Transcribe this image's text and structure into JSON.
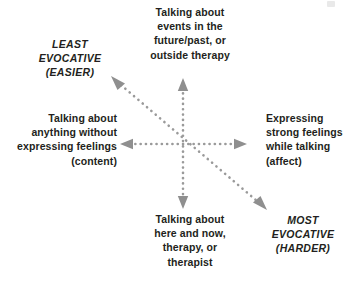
{
  "diagram": {
    "axes": {
      "vertical": {
        "top_label": "Talking about events in the future/past, or outside therapy",
        "top_lines": [
          "Talking about",
          "events in the",
          "future/past, or",
          "outside therapy"
        ],
        "bottom_label": "Talking about here and now, therapy, or therapist",
        "bottom_lines": [
          "Talking about",
          "here and now,",
          "therapy, or",
          "therapist"
        ]
      },
      "horizontal": {
        "left_label": "Talking about anything without expressing feelings (content)",
        "left_lines": [
          "Talking about",
          "anything without",
          "expressing feelings",
          "(content)"
        ],
        "right_label": "Expressing strong feelings while talking (affect)",
        "right_lines": [
          "Expressing",
          "strong feelings",
          "while talking",
          "(affect)"
        ]
      },
      "diagonal": {
        "upper_left_label": "LEAST EVOCATIVE (EASIER)",
        "upper_left_lines": [
          "LEAST",
          "EVOCATIVE",
          "(EASIER)"
        ],
        "lower_right_label": "MOST EVOCATIVE (HARDER)",
        "lower_right_lines": [
          "MOST",
          "EVOCATIVE",
          "(HARDER)"
        ]
      }
    },
    "style": {
      "line_style": "dotted",
      "line_color": "#9a9a9a",
      "arrowhead_color": "#8f8f8f",
      "text_color": "#231f20",
      "background": "#ffffff"
    },
    "geometry": {
      "center_x": 183,
      "center_y": 144,
      "vertical_top_y": 80,
      "vertical_bottom_y": 207,
      "horizontal_left_x": 122,
      "horizontal_right_x": 245,
      "diagonal_upper_left": [
        113,
        78
      ],
      "diagonal_lower_right": [
        265,
        208
      ]
    }
  },
  "icons": {
    "arrow_up": "arrow-up-icon",
    "arrow_down": "arrow-down-icon",
    "arrow_left": "arrow-left-icon",
    "arrow_right": "arrow-right-icon",
    "arrow_upper_left": "arrow-upper-left-icon",
    "arrow_lower_right": "arrow-lower-right-icon"
  }
}
